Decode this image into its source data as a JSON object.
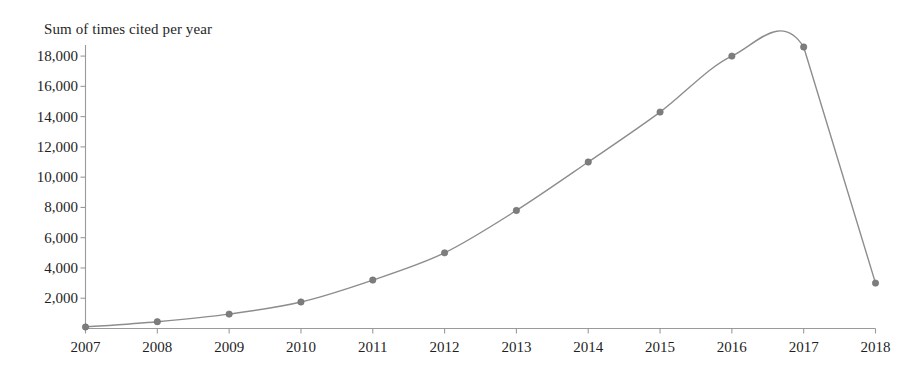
{
  "chart_data": {
    "type": "line",
    "title": "Sum of times cited per year",
    "xlabel": "",
    "ylabel": "",
    "categories": [
      "2007",
      "2008",
      "2009",
      "2010",
      "2011",
      "2012",
      "2013",
      "2014",
      "2015",
      "2016",
      "2017",
      "2018"
    ],
    "values": [
      100,
      450,
      950,
      1750,
      3200,
      5000,
      7800,
      11000,
      14300,
      18000,
      18600,
      3000
    ],
    "series": [
      {
        "name": "Sum of times cited per year",
        "values": [
          100,
          450,
          950,
          1750,
          3200,
          5000,
          7800,
          11000,
          14300,
          18000,
          18600,
          3000
        ]
      }
    ],
    "x_tick_labels": [
      "2007",
      "2008",
      "2009",
      "2010",
      "2011",
      "2012",
      "2013",
      "2014",
      "2015",
      "2016",
      "2017",
      "2018"
    ],
    "y_tick_labels": [
      "18,000",
      "16,000",
      "14,000",
      "12,000",
      "10,000",
      "8,000",
      "6,000",
      "4,000",
      "2,000"
    ],
    "y_tick_values": [
      18000,
      16000,
      14000,
      12000,
      10000,
      8000,
      6000,
      4000,
      2000
    ],
    "ylim": [
      0,
      18600
    ],
    "y_tick_interval": 2000,
    "grid": false,
    "legend": false,
    "legend_position": "none",
    "marker": "circle",
    "line_color": "#8d8d8d",
    "marker_color": "#7d7d7d",
    "axis_color": "#9a9a9a",
    "text_color": "#1f1f1f",
    "background_color": "#ffffff"
  }
}
